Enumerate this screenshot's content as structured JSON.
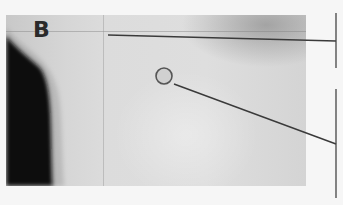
{
  "figure": {
    "panel_label": "B",
    "colors": {
      "background": "#f6f6f6",
      "annotation_line": "#3a3a3a",
      "dark_region": "#0a0a0a",
      "marker_fill": "#d0d0d0"
    },
    "annotations": [
      {
        "id": "upper",
        "type": "horizontal-leader",
        "bracket": "upper-bracket"
      },
      {
        "id": "lower",
        "type": "circle-marker-leader",
        "bracket": "lower-bracket"
      }
    ]
  }
}
